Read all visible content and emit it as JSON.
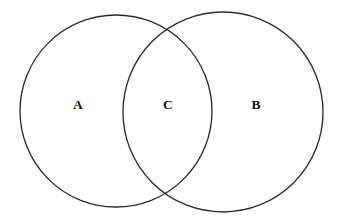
{
  "figure": {
    "kind": "venn-diagram",
    "title": "",
    "background_color": "#ffffff",
    "stroke_color": "#2b2b2b",
    "label_color": "#101010",
    "width": 346,
    "height": 223
  },
  "circles": [
    {
      "id": "set-a",
      "name": "left-circle",
      "cx": 116,
      "cy": 111,
      "r": 96
    },
    {
      "id": "set-b",
      "name": "right-circle",
      "cx": 223,
      "cy": 112,
      "r": 100
    }
  ],
  "labels": [
    {
      "id": "label-a",
      "text": "A",
      "x": 78,
      "y": 105,
      "region": "left-only"
    },
    {
      "id": "label-c",
      "text": "C",
      "x": 168,
      "y": 105,
      "region": "intersection"
    },
    {
      "id": "label-b",
      "text": "B",
      "x": 256,
      "y": 105,
      "region": "right-only"
    }
  ]
}
